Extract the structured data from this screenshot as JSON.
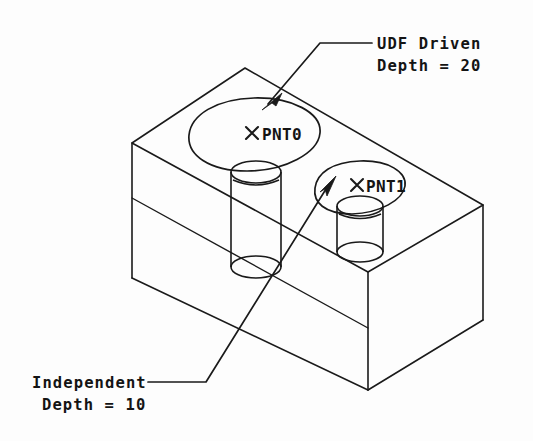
{
  "canvas": {
    "width": 533,
    "height": 441,
    "background": "#fdfdfd",
    "line_color": "#1a1a1a",
    "text_color": "#141414"
  },
  "drawing": {
    "type": "isometric-engineering-drawing",
    "subject": "rectangular block with two drilled holes",
    "view": "isometric"
  },
  "annotations": {
    "udf": {
      "line1": "UDF Driven",
      "line2": "Depth = 20",
      "target": "PNT0 hole sketch"
    },
    "independent": {
      "line1": "Independent",
      "line2": "Depth = 10",
      "target": "PNT1 hole sketch"
    }
  },
  "points": [
    {
      "id": "pnt0",
      "label": "PNT0",
      "marker": "x-cross",
      "depth": 20,
      "driven_by": "UDF Driven"
    },
    {
      "id": "pnt1",
      "label": "PNT1",
      "marker": "x-cross",
      "depth": 10,
      "driven_by": "Independent"
    }
  ],
  "icons": {
    "cross_marker": "x-cross-icon",
    "arrow_marker": "leader-arrow-icon"
  }
}
